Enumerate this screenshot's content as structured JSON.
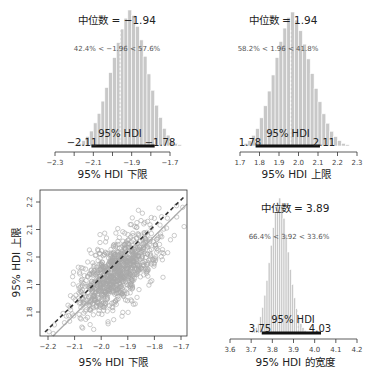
{
  "chart_data": [
    {
      "type": "bar",
      "panel": "top-left",
      "title": "中位数 = −1.94",
      "comparison_text": "42.4% < −1.96 < 57.6%",
      "xlabel": "95% HDI 下限",
      "ylabel": "",
      "xlim": [
        -2.3,
        -1.7
      ],
      "xticks": [
        "−2.3",
        "−2.1",
        "−1.9",
        "−1.7"
      ],
      "minor_ticks": [
        -2.3,
        -2.2,
        -2.1,
        -2.0,
        -1.9,
        -1.8,
        -1.7
      ],
      "median": -1.94,
      "comparison_value": -1.96,
      "hdi": {
        "label": "95% HDI",
        "low": -2.11,
        "high": -1.78,
        "low_label": "−2.11",
        "high_label": "−1.78"
      },
      "bins": {
        "start": -2.2,
        "width": 0.02,
        "values": [
          1,
          2,
          4,
          7,
          11,
          17,
          24,
          33,
          43,
          54,
          65,
          76,
          86,
          94,
          100,
          96,
          88,
          78,
          66,
          53,
          41,
          30,
          21,
          13,
          8,
          4,
          2,
          1
        ]
      }
    },
    {
      "type": "bar",
      "panel": "top-right",
      "title": "中位数 = 1.94",
      "comparison_text": "58.2% < 1.96 < 41.8%",
      "xlabel": "95% HDI 上限",
      "ylabel": "",
      "xlim": [
        1.7,
        2.3
      ],
      "xticks": [
        "1.7",
        "1.8",
        "1.9",
        "2.0",
        "2.1",
        "2.2",
        "2.3"
      ],
      "median": 1.94,
      "comparison_value": 1.96,
      "hdi": {
        "label": "95% HDI",
        "low": 1.78,
        "high": 2.11,
        "low_label": "1.78",
        "high_label": "2.11"
      },
      "bins": {
        "start": 1.7,
        "width": 0.02,
        "values": [
          1,
          2,
          4,
          8,
          13,
          21,
          30,
          41,
          53,
          66,
          78,
          88,
          96,
          100,
          94,
          86,
          76,
          65,
          54,
          43,
          33,
          24,
          17,
          11,
          7,
          4,
          2,
          1
        ]
      }
    },
    {
      "type": "scatter",
      "panel": "bottom-left",
      "title": "",
      "xlabel": "95% HDI 下限",
      "ylabel": "95% HDI 上限",
      "xlim": [
        -2.22,
        -1.69
      ],
      "ylim": [
        1.73,
        2.25
      ],
      "xticks": [
        "−2.2",
        "−2.1",
        "−2.0",
        "−1.9",
        "−1.8",
        "−1.7"
      ],
      "yticks": [
        "1.8",
        "1.9",
        "2.0",
        "2.1",
        "2.2"
      ],
      "center": {
        "x": -1.94,
        "y": 1.94
      },
      "spread": {
        "x": 0.08,
        "y": 0.08
      },
      "correlation": 0.65,
      "n_points": 1000,
      "lines": [
        {
          "style": "dashed",
          "color": "#333333",
          "description": "y = -x"
        },
        {
          "style": "solid",
          "color": "#aaaaaa",
          "description": "reference line (slope 1, offset)"
        }
      ]
    },
    {
      "type": "bar",
      "panel": "bottom-right",
      "title": "中位数 = 3.89",
      "comparison_text": "66.4% < 3.92 < 33.6%",
      "xlabel": "95% HDI 的宽度",
      "ylabel": "",
      "xlim": [
        3.6,
        4.2
      ],
      "xticks": [
        "3.6",
        "3.7",
        "3.8",
        "3.9",
        "4.0",
        "4.1",
        "4.2"
      ],
      "median": 3.89,
      "comparison_value": 3.92,
      "hdi": {
        "label": "95% HDI",
        "low": 3.75,
        "high": 4.03,
        "low_label": "3.75",
        "high_label": "4.03"
      },
      "bins": {
        "start": 3.7,
        "width": 0.01,
        "values": [
          1,
          2,
          4,
          7,
          12,
          19,
          28,
          39,
          52,
          65,
          78,
          89,
          97,
          100,
          95,
          85,
          73,
          60,
          47,
          36,
          26,
          18,
          12,
          7,
          4,
          2,
          1,
          1,
          1
        ]
      }
    }
  ],
  "labels": {
    "p1_title": "中位数 = −1.94",
    "p1_compare": "42.4% < −1.96 < 57.6%",
    "p1_hdi": "95% HDI",
    "p1_low": "−2.11",
    "p1_high": "−1.78",
    "p1_xlabel": "95% HDI 下限",
    "p2_title": "中位数 = 1.94",
    "p2_compare": "58.2% < 1.96 < 41.8%",
    "p2_hdi": "95% HDI",
    "p2_low": "1.78",
    "p2_high": "2.11",
    "p2_xlabel": "95% HDI 上限",
    "p3_xlabel": "95% HDI 下限",
    "p3_ylabel": "95% HDI 上限",
    "p4_title": "中位数 = 3.89",
    "p4_compare": "66.4% < 3.92 < 33.6%",
    "p4_hdi": "95% HDI",
    "p4_low": "3.75",
    "p4_high": "4.03",
    "p4_xlabel": "95% HDI 的宽度"
  },
  "colors": {
    "bar_fill": "#c8c8c8",
    "bar_stroke": "#ffffff",
    "axis": "#333333",
    "tick_text": "#444444",
    "hdi_bar": "#111111",
    "median_line": "#ffffff",
    "scatter_point": "#a8a8a8",
    "label_text": "#222222"
  }
}
